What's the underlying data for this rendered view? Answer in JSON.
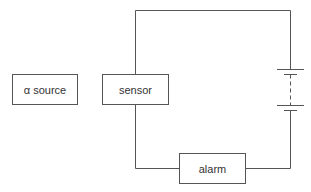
{
  "diagram": {
    "type": "circuit",
    "components": {
      "source": {
        "label": "α source"
      },
      "sensor": {
        "label": "sensor"
      },
      "alarm": {
        "label": "alarm"
      },
      "battery": {
        "symbol": "battery-cells"
      }
    },
    "colors": {
      "line": "#555555",
      "text": "#333333",
      "background": "#ffffff"
    }
  }
}
